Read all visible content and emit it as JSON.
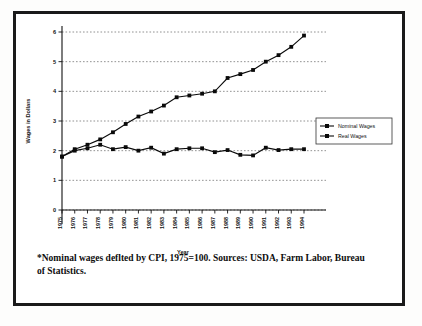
{
  "figure": {
    "caption": "*Nominal wages deflted by CPI, 1975=100. Sources: USDA, Farm Labor, Bureau of Statistics."
  },
  "chart_data": {
    "type": "line",
    "title": "",
    "xlabel": "Year",
    "ylabel": "Wages in Dollars",
    "ylim": [
      0,
      6
    ],
    "yticks": [
      0,
      1,
      2,
      3,
      4,
      5,
      6
    ],
    "ytick_labels": [
      "0",
      "1",
      "2",
      "3",
      "4",
      "5",
      "6"
    ],
    "grid": true,
    "legend_position": "right",
    "categories": [
      "1975",
      "1976",
      "1977",
      "1978",
      "1979",
      "1980",
      "1981",
      "1982",
      "1983",
      "1984",
      "1985",
      "1986",
      "1987",
      "1988",
      "1989",
      "1990",
      "1991",
      "1992",
      "1993",
      "1994"
    ],
    "series": [
      {
        "name": "Nominal Wages",
        "marker": "square",
        "color": "#0a0a0a",
        "values": [
          1.8,
          2.05,
          2.2,
          2.38,
          2.62,
          2.9,
          3.15,
          3.32,
          3.52,
          3.8,
          3.86,
          3.92,
          4.0,
          4.45,
          4.58,
          4.72,
          5.0,
          5.22,
          5.5,
          5.88
        ]
      },
      {
        "name": "Real Wages",
        "marker": "square",
        "color": "#0a0a0a",
        "values": [
          1.8,
          2.0,
          2.08,
          2.2,
          2.05,
          2.12,
          2.0,
          2.1,
          1.9,
          2.05,
          2.08,
          2.08,
          1.95,
          2.02,
          1.86,
          1.84,
          2.1,
          2.02,
          2.05,
          2.05
        ]
      }
    ]
  }
}
